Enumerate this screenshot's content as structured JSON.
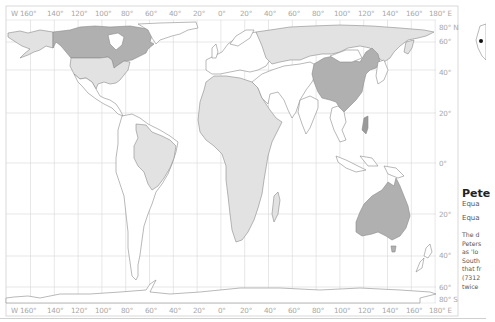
{
  "map": {
    "projection": "Peters",
    "top_longitude_labels": [
      "W 160°",
      "140°",
      "120°",
      "100°",
      "80°",
      "60°",
      "40°",
      "20°",
      "0°",
      "20°",
      "40°",
      "60°",
      "80°",
      "100°",
      "120°",
      "140°",
      "160°",
      "180° E"
    ],
    "bottom_longitude_labels": [
      "W 160°",
      "140°",
      "120°",
      "100°",
      "80°",
      "60°",
      "40°",
      "20°",
      "0°",
      "20°",
      "40°",
      "60°",
      "80°",
      "100°",
      "120°",
      "140°",
      "160°",
      "180° E"
    ],
    "latitude_labels": [
      "80° N",
      "60°",
      "40°",
      "20°",
      "0°",
      "20°",
      "40°",
      "60°",
      "80° S"
    ],
    "highlighted_regions": [
      "Canada",
      "China",
      "Australia"
    ],
    "light_regions": [
      "USA",
      "Alaska",
      "Russia",
      "Africa",
      "Brazil",
      "Greenland"
    ],
    "colors": {
      "dark_fill": "#b0b0b0",
      "light_fill": "#e2e2e2",
      "grid": "#d4d4d4",
      "coast": "#8a8a8a"
    }
  },
  "side_panel": {
    "title": "Pete",
    "line1": "Equa",
    "line2": "Equa",
    "body_lines": [
      "The d",
      "Peters",
      "as 'lo",
      "South",
      "that fr",
      "(7312",
      "twice"
    ]
  }
}
